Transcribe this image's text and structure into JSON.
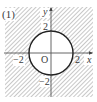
{
  "figure": {
    "label": "(1)",
    "x_axis_label": "x",
    "y_axis_label": "y",
    "origin_label": "O",
    "ticks": {
      "y_pos": "2",
      "y_neg": "−2",
      "x_pos": "2",
      "x_neg": "−2"
    },
    "circle": {
      "center": [
        0,
        0
      ],
      "radius": 2,
      "boundary": "solid"
    },
    "shaded_region": "outside circle",
    "colors": {
      "hatch": "#9a9a9a",
      "axis": "#555555",
      "circle": "#222222",
      "text": "#3a3a3a"
    }
  }
}
